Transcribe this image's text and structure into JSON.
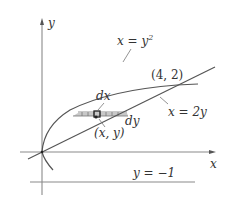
{
  "diagram": {
    "axes": {
      "x_label": "x",
      "y_label": "y"
    },
    "curves": [
      {
        "id": "parabola",
        "label": "x = y",
        "label_sup": "2",
        "equation": "x = y^2"
      },
      {
        "id": "line",
        "label": "x = 2y",
        "equation": "x = 2y"
      },
      {
        "id": "horizontal",
        "label": "y = −1",
        "equation": "y = -1"
      }
    ],
    "points": [
      {
        "id": "intersection",
        "label": "(4, 2)"
      },
      {
        "id": "sample-point",
        "label": "(x, y)"
      }
    ],
    "differentials": {
      "dx_label": "dx",
      "dy_label": "dy"
    },
    "colors": {
      "axis": "#8a8a8a",
      "curve": "#555555",
      "shade": "#c8c8c8",
      "text": "#333333"
    }
  }
}
